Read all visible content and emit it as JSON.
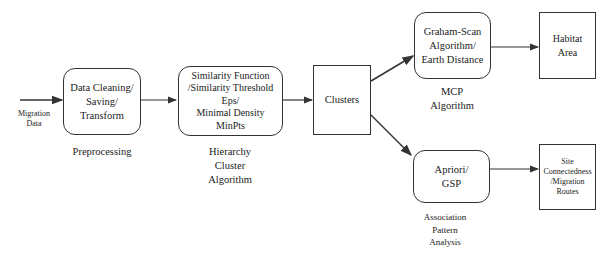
{
  "diagram": {
    "input": {
      "label": "Migration\nData"
    },
    "nodes": [
      {
        "id": "preprocess",
        "text": "Data Cleaning/\nSaving/\nTransform",
        "caption": "Preprocessing",
        "shape": "rounded"
      },
      {
        "id": "hierarchy",
        "text": "Similarity Function\n/Similarity Threshold\nEps/\nMinimal Density\nMinPts",
        "caption": "Hierarchy\nCluster\nAlgorithm",
        "shape": "rounded"
      },
      {
        "id": "clusters",
        "text": "Clusters",
        "caption": "",
        "shape": "rect"
      },
      {
        "id": "mcp",
        "text": "Graham-Scan\nAlgorithm/\nEarth Distance",
        "caption": "MCP\nAlgorithm",
        "shape": "rounded"
      },
      {
        "id": "habitat",
        "text": "Habitat\nArea",
        "caption": "",
        "shape": "rect"
      },
      {
        "id": "association",
        "text": "Apriori/\nGSP",
        "caption": "Association\nPattern\nAnalysis",
        "shape": "rounded"
      },
      {
        "id": "site",
        "text": "Site\nConnectedness\n/Migration\nRoutes",
        "caption": "",
        "shape": "rect"
      }
    ],
    "edges": [
      {
        "from": "input",
        "to": "preprocess"
      },
      {
        "from": "preprocess",
        "to": "hierarchy"
      },
      {
        "from": "hierarchy",
        "to": "clusters"
      },
      {
        "from": "clusters",
        "to": "mcp"
      },
      {
        "from": "clusters",
        "to": "association"
      },
      {
        "from": "mcp",
        "to": "habitat"
      },
      {
        "from": "association",
        "to": "site"
      }
    ]
  }
}
